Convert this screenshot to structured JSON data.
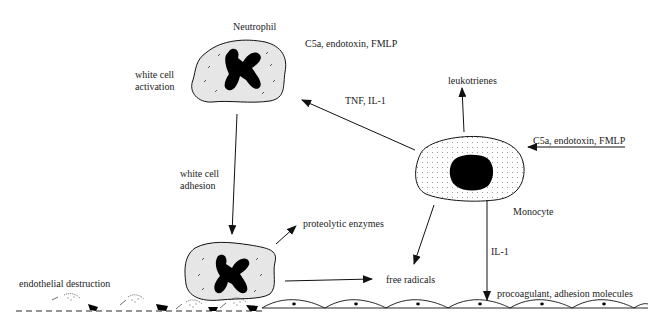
{
  "diagram": {
    "colors": {
      "ink": "#111111",
      "cell_fill": "#e6e6e6",
      "monocyte_fill": "#ffffff",
      "nucleus": "#000000",
      "background": "#ffffff"
    },
    "labels": {
      "neutrophil": "Neutrophil",
      "neutrophil_stimuli": "C5a, endotoxin, FMLP",
      "white_cell_activation_1": "white cell",
      "white_cell_activation_2": "activation",
      "tnf_il1": "TNF, IL-1",
      "leukotrienes": "leukotrienes",
      "monocyte_stimuli": "C5a, endotoxin, FMLP",
      "white_cell_adhesion_1": "white cell",
      "white_cell_adhesion_2": "adhesion",
      "monocyte": "Monocyte",
      "proteolytic_enzymes": "proteolytic enzymes",
      "il1": "IL-1",
      "free_radicals": "free radicals",
      "endothelial_destruction": "endothelial destruction",
      "procoagulant": "procoagulant, adhesion molecules"
    }
  }
}
